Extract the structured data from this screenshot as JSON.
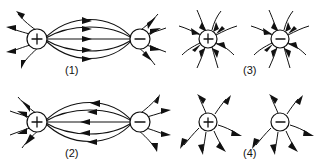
{
  "figure": {
    "type": "electric-field-line-diagram-set",
    "background_color": "#ffffff",
    "ink_color": "#111111",
    "panel_count": 4
  },
  "panels": [
    {
      "id": "panel-1",
      "label": "(1)",
      "layout": "dipole-pair",
      "left_charge": "+",
      "right_charge": "−",
      "field_line_arrow_direction": "left-to-right",
      "left_outer_arrow_direction": "outward",
      "right_outer_arrow_direction": "inward",
      "connecting_line_count": 5,
      "outer_ray_count_left": 4,
      "outer_ray_count_right": 4
    },
    {
      "id": "panel-2",
      "label": "(2)",
      "layout": "dipole-pair",
      "left_charge": "+",
      "right_charge": "−",
      "field_line_arrow_direction": "right-to-left",
      "left_outer_arrow_direction": "inward",
      "right_outer_arrow_direction": "outward",
      "connecting_line_count": 5,
      "outer_ray_count_left": 4,
      "outer_ray_count_right": 4
    },
    {
      "id": "panel-3",
      "label": "(3)",
      "layout": "separate-charges",
      "left_charge": "+",
      "right_charge": "−",
      "left_arrow_direction": "inward",
      "right_arrow_direction": "inward",
      "rays_per_charge": 8
    },
    {
      "id": "panel-4",
      "label": "(4)",
      "layout": "separate-charges",
      "left_charge": "+",
      "right_charge": "−",
      "left_arrow_direction": "outward",
      "right_arrow_direction": "outward",
      "rays_per_charge": 6
    }
  ],
  "symbols": {
    "positive": "+",
    "negative": "−"
  }
}
